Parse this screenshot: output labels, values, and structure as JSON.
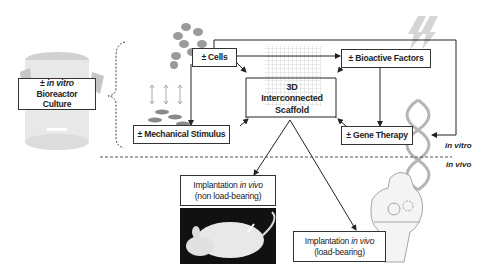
{
  "diagram": {
    "bioreactor": {
      "prefix": "± ",
      "italic": "in vitro",
      "rest": " Bioreactor",
      "line2": "Culture"
    },
    "cells": {
      "label": "± Cells"
    },
    "bioactive": {
      "label": "± Bioactive Factors"
    },
    "mechanical": {
      "label": "± Mechanical Stimulus"
    },
    "gene": {
      "label": "± Gene Therapy"
    },
    "scaffold": {
      "line1": "3D",
      "line2": "Interconnected",
      "line3": "Scaffold"
    },
    "implant_non": {
      "prefix": "Implantation ",
      "italic": "in vivo",
      "line2": "(non load-bearing)"
    },
    "implant_load": {
      "prefix": "Implantation ",
      "italic": "in vivo",
      "line2": "(load-bearing)"
    },
    "in_vitro_label": "in vitro",
    "in_vivo_label": "in vivo"
  },
  "colors": {
    "line": "#222222",
    "dashed": "#555555",
    "illustration": "#bdbdbd"
  }
}
